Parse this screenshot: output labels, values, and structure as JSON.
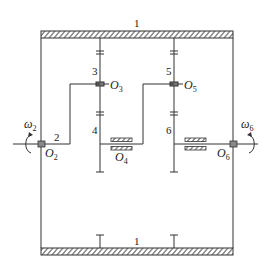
{
  "diagram": {
    "type": "gear-train-kinematic-sketch",
    "frame": {
      "label_top": "1",
      "label_bottom": "1"
    },
    "gears": [
      {
        "id": "3",
        "label": "3"
      },
      {
        "id": "4",
        "label": "4"
      },
      {
        "id": "5",
        "label": "5"
      },
      {
        "id": "6",
        "label": "6"
      }
    ],
    "arm": {
      "label": "2"
    },
    "points": {
      "O2": {
        "base": "O",
        "sub": "2"
      },
      "O3": {
        "base": "O",
        "sub": "3"
      },
      "O4": {
        "base": "O",
        "sub": "4"
      },
      "O5": {
        "base": "O",
        "sub": "5"
      },
      "O6": {
        "base": "O",
        "sub": "6"
      }
    },
    "angular_velocities": {
      "w2": {
        "base": "ω",
        "sub": "2"
      },
      "w6": {
        "base": "ω",
        "sub": "6"
      }
    },
    "colors": {
      "line": "#333333",
      "hatch": "#444444",
      "background": "#ffffff"
    }
  }
}
